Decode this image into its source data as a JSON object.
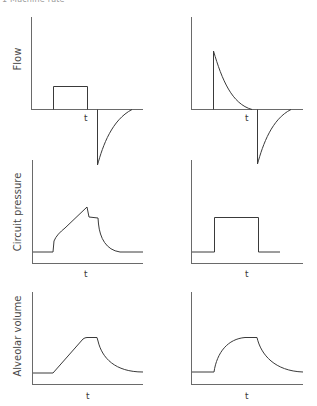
{
  "header": {
    "caption": "1  Machine rate"
  },
  "rows": [
    {
      "ylabel": "Flow"
    },
    {
      "ylabel": "Circuit pressure"
    },
    {
      "ylabel": "Alveolar volume"
    }
  ],
  "xlabel": "t",
  "panels": {
    "flow_left": {
      "description": "Constant inspiratory flow (square wave), passive exponential expiratory flow"
    },
    "flow_right": {
      "description": "Decelerating inspiratory flow (pressure-controlled), passive exponential expiratory flow"
    },
    "pressure_left": {
      "description": "Volume-controlled: step, ramp, peak then plateau, exponential decay"
    },
    "pressure_right": {
      "description": "Pressure-controlled: square pressure wave"
    },
    "volume_left": {
      "description": "Linear rise, plateau, exponential fall"
    },
    "volume_right": {
      "description": "Exponential rise, plateau, exponential fall"
    }
  },
  "colors": {
    "line": "#3a3a3a",
    "axis": "#6a6a6a",
    "background": "#ffffff"
  }
}
